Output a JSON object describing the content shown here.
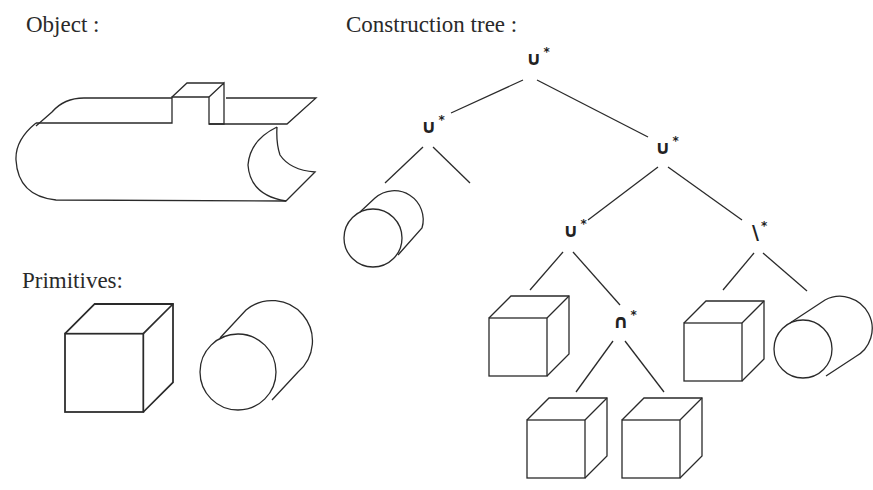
{
  "labels": {
    "object": "Object :",
    "primitives": "Primitives:",
    "construction_tree": "Construction tree :"
  },
  "tree": {
    "root": {
      "op": "∪",
      "mark": "*"
    },
    "left": {
      "op": "∪",
      "mark": "*",
      "children": [
        "cylinder",
        "cube"
      ]
    },
    "right": {
      "op": "∪",
      "mark": "*"
    },
    "right_left": {
      "op": "∪",
      "mark": "*",
      "children": [
        "cube",
        "intersection"
      ]
    },
    "right_right": {
      "op": "\\",
      "mark": "*",
      "children": [
        "cube",
        "cylinder"
      ]
    },
    "intersection": {
      "op": "∩",
      "mark": "*",
      "children": [
        "cube",
        "cube"
      ]
    }
  },
  "primitives": [
    "cube",
    "cylinder"
  ]
}
